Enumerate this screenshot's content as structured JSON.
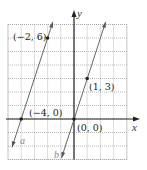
{
  "chart_data": {
    "type": "line",
    "title": "",
    "xlabel": "x",
    "ylabel": "y",
    "xlim": [
      -5,
      4
    ],
    "ylim": [
      -3,
      7
    ],
    "grid": true,
    "grid_style": "dotted",
    "series": [
      {
        "name": "a",
        "equation": "y = 3x + 12",
        "slope": 3,
        "points": [
          {
            "x": -4,
            "y": 0,
            "label": "(−4, 0)"
          },
          {
            "x": -2,
            "y": 6,
            "label": "(−2, 6)"
          }
        ],
        "extent": [
          [
            -4.7,
            -2.1
          ],
          [
            -1.6,
            7.2
          ]
        ]
      },
      {
        "name": "b",
        "equation": "y = 3x",
        "slope": 3,
        "points": [
          {
            "x": 0,
            "y": 0,
            "label": "(0, 0)"
          },
          {
            "x": 1,
            "y": 3,
            "label": "(1, 3)"
          }
        ],
        "extent": [
          [
            -0.95,
            -2.9
          ],
          [
            2.4,
            7.2
          ]
        ]
      }
    ]
  },
  "labels": {
    "x_axis": "x",
    "y_axis": "y",
    "line_a": "a",
    "line_b": "b",
    "pt_a1": "(−4, 0)",
    "pt_a2": "(−2, 6)",
    "pt_b1": "(0, 0)",
    "pt_b2": "(1, 3)"
  }
}
